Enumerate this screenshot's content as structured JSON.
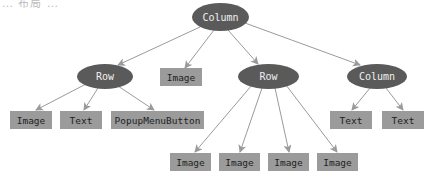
{
  "captions": {
    "top": "… 布局 …",
    "bottom": ""
  },
  "colors": {
    "container_fill": "#5a5a5a",
    "container_text": "#f0f0f0",
    "leaf_fill": "#9b9b9b",
    "leaf_text": "#222222",
    "edge": "#9a9a9a"
  },
  "tree": {
    "root": {
      "label": "Column"
    },
    "row_left": {
      "label": "Row"
    },
    "image_mid": {
      "label": "Image"
    },
    "row_right": {
      "label": "Row"
    },
    "column_right": {
      "label": "Column"
    },
    "row_left_children": [
      {
        "label": "Image"
      },
      {
        "label": "Text"
      },
      {
        "label": "PopupMenuButton"
      }
    ],
    "row_right_children": [
      {
        "label": "Image"
      },
      {
        "label": "Image"
      },
      {
        "label": "Image"
      },
      {
        "label": "Image"
      }
    ],
    "column_right_children": [
      {
        "label": "Text"
      },
      {
        "label": "Text"
      }
    ]
  }
}
